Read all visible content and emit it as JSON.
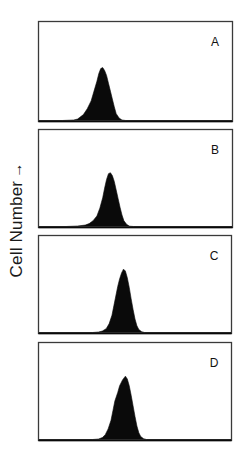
{
  "chart_data": {
    "type": "area",
    "title": "",
    "xlabel": "",
    "ylabel": "Cell Number",
    "ylabel_arrow": "→",
    "grid": false,
    "legend": null,
    "panels": [
      {
        "label": "A",
        "box": {
          "x": 38,
          "y": 21,
          "w": 194,
          "h": 100
        },
        "peak_x_frac": 0.325,
        "peak_height_frac": 0.54,
        "profile": [
          [
            0.0,
            0.0
          ],
          [
            0.12,
            0.0
          ],
          [
            0.18,
            0.005
          ],
          [
            0.2,
            0.015
          ],
          [
            0.21,
            0.03
          ],
          [
            0.23,
            0.06
          ],
          [
            0.25,
            0.12
          ],
          [
            0.27,
            0.2
          ],
          [
            0.285,
            0.3
          ],
          [
            0.3,
            0.4
          ],
          [
            0.31,
            0.48
          ],
          [
            0.32,
            0.53
          ],
          [
            0.33,
            0.54
          ],
          [
            0.34,
            0.51
          ],
          [
            0.35,
            0.46
          ],
          [
            0.36,
            0.38
          ],
          [
            0.37,
            0.3
          ],
          [
            0.38,
            0.22
          ],
          [
            0.39,
            0.14
          ],
          [
            0.4,
            0.07
          ],
          [
            0.415,
            0.025
          ],
          [
            0.43,
            0.005
          ],
          [
            0.45,
            0.0
          ],
          [
            1.0,
            0.0
          ]
        ]
      },
      {
        "label": "B",
        "box": {
          "x": 38,
          "y": 129,
          "w": 194,
          "h": 98
        },
        "peak_x_frac": 0.365,
        "peak_height_frac": 0.56,
        "profile": [
          [
            0.0,
            0.0
          ],
          [
            0.14,
            0.0
          ],
          [
            0.2,
            0.005
          ],
          [
            0.24,
            0.015
          ],
          [
            0.26,
            0.03
          ],
          [
            0.28,
            0.06
          ],
          [
            0.3,
            0.11
          ],
          [
            0.315,
            0.19
          ],
          [
            0.33,
            0.3
          ],
          [
            0.34,
            0.4
          ],
          [
            0.35,
            0.49
          ],
          [
            0.36,
            0.55
          ],
          [
            0.37,
            0.56
          ],
          [
            0.38,
            0.53
          ],
          [
            0.39,
            0.47
          ],
          [
            0.4,
            0.38
          ],
          [
            0.41,
            0.29
          ],
          [
            0.42,
            0.2
          ],
          [
            0.43,
            0.12
          ],
          [
            0.44,
            0.06
          ],
          [
            0.455,
            0.02
          ],
          [
            0.47,
            0.003
          ],
          [
            0.49,
            0.0
          ],
          [
            1.0,
            0.0
          ]
        ]
      },
      {
        "label": "C",
        "box": {
          "x": 38,
          "y": 235,
          "w": 193,
          "h": 98
        },
        "peak_x_frac": 0.445,
        "peak_height_frac": 0.66,
        "profile": [
          [
            0.0,
            0.0
          ],
          [
            0.28,
            0.0
          ],
          [
            0.31,
            0.005
          ],
          [
            0.33,
            0.015
          ],
          [
            0.35,
            0.04
          ],
          [
            0.365,
            0.09
          ],
          [
            0.38,
            0.18
          ],
          [
            0.39,
            0.28
          ],
          [
            0.4,
            0.38
          ],
          [
            0.41,
            0.48
          ],
          [
            0.42,
            0.56
          ],
          [
            0.43,
            0.62
          ],
          [
            0.44,
            0.66
          ],
          [
            0.45,
            0.64
          ],
          [
            0.46,
            0.57
          ],
          [
            0.47,
            0.47
          ],
          [
            0.48,
            0.35
          ],
          [
            0.49,
            0.24
          ],
          [
            0.5,
            0.14
          ],
          [
            0.51,
            0.07
          ],
          [
            0.52,
            0.03
          ],
          [
            0.535,
            0.008
          ],
          [
            0.55,
            0.0
          ],
          [
            1.0,
            0.0
          ]
        ]
      },
      {
        "label": "D",
        "box": {
          "x": 38,
          "y": 342,
          "w": 193,
          "h": 98
        },
        "peak_x_frac": 0.45,
        "peak_height_frac": 0.66,
        "profile": [
          [
            0.0,
            0.0
          ],
          [
            0.28,
            0.0
          ],
          [
            0.31,
            0.005
          ],
          [
            0.33,
            0.02
          ],
          [
            0.345,
            0.05
          ],
          [
            0.36,
            0.11
          ],
          [
            0.375,
            0.2
          ],
          [
            0.385,
            0.3
          ],
          [
            0.395,
            0.4
          ],
          [
            0.41,
            0.49
          ],
          [
            0.42,
            0.56
          ],
          [
            0.435,
            0.62
          ],
          [
            0.45,
            0.66
          ],
          [
            0.46,
            0.63
          ],
          [
            0.47,
            0.56
          ],
          [
            0.48,
            0.46
          ],
          [
            0.49,
            0.35
          ],
          [
            0.5,
            0.24
          ],
          [
            0.51,
            0.14
          ],
          [
            0.52,
            0.07
          ],
          [
            0.53,
            0.03
          ],
          [
            0.545,
            0.008
          ],
          [
            0.56,
            0.0
          ],
          [
            1.0,
            0.0
          ]
        ]
      }
    ]
  },
  "figure": {
    "ylabel_text": "Cell Number",
    "ylabel_arrow": "→",
    "panel_labels": [
      "A",
      "B",
      "C",
      "D"
    ],
    "colors": {
      "background": "#ffffff",
      "fill": "#0a0a0a",
      "frame": "#3a3a3a",
      "text": "#1a1a1a"
    }
  }
}
